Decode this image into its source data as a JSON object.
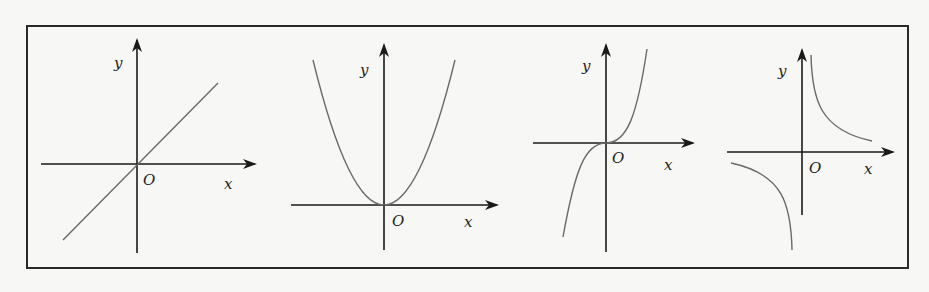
{
  "figure": {
    "frame_color": "#2a2a2a",
    "axis_color": "#1a1a1a",
    "curve_color": "#6a6a6a",
    "graphs": [
      {
        "id": "linear",
        "function": "y = x",
        "x_label": "x",
        "y_label": "y",
        "origin_label": "O"
      },
      {
        "id": "quadratic",
        "function": "y = x^2",
        "x_label": "x",
        "y_label": "y",
        "origin_label": "O"
      },
      {
        "id": "cubic",
        "function": "y = x^3",
        "x_label": "x",
        "y_label": "y",
        "origin_label": "O"
      },
      {
        "id": "reciprocal",
        "function": "y = 1/x",
        "x_label": "x",
        "y_label": "y",
        "origin_label": "O"
      }
    ]
  }
}
